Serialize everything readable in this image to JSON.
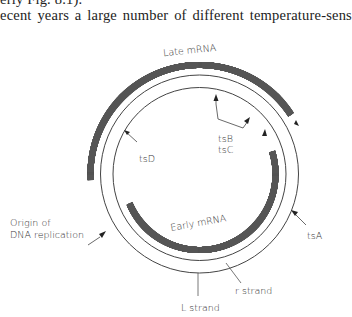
{
  "text": {
    "line1": "erly  Fig. 8.1).",
    "line2": "ecent years a large number of different temperature-sens"
  },
  "diagram": {
    "labels": {
      "late_mrna": "Late mRNA",
      "early_mrna": "Early mRNA",
      "tsA": "tsA",
      "tsB": "tsB",
      "tsC": "tsC",
      "tsD": "tsD",
      "origin_line1": "Origin of",
      "origin_line2": "DNA replication",
      "r_strand": "r strand",
      "l_strand": "L strand"
    },
    "colors": {
      "line": "#444444",
      "text": "#333333"
    }
  }
}
